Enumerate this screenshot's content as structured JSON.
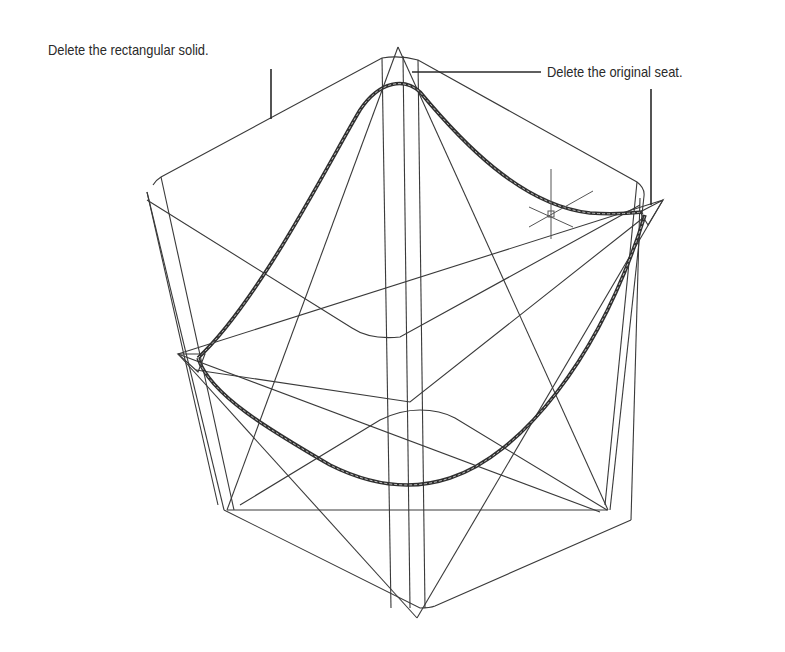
{
  "figure": {
    "width": 785,
    "height": 652,
    "background": "#ffffff",
    "line_color": "#3a3a3a",
    "seat_color": "#2f2f2f"
  },
  "callouts": {
    "rectangular_solid": {
      "text": "Delete the rectangular solid.",
      "leader": {
        "x1": 271,
        "y1": 69,
        "x2": 271,
        "y2": 119
      }
    },
    "original_seat": {
      "text": "Delete the original seat.",
      "leader_h": {
        "x1": 412,
        "y1": 72,
        "x2": 541,
        "y2": 72
      },
      "leader_v": {
        "x1": 651,
        "y1": 89,
        "x2": 651,
        "y2": 205
      }
    }
  },
  "cursor": {
    "type": "crosshair-pickbox",
    "x": 551,
    "y": 214
  },
  "geometry": {
    "box_outline_top": "M153,185 Q156,180 161,177 L382,58 Q400,55 418,60 L637,182 Q645,188 644,196",
    "box_outline_bottom": "M224,510 L420,608 Q430,608 435,606 L631,520",
    "box_verticals": [
      [
        147,
        192,
        224,
        510
      ],
      [
        161,
        177,
        234,
        510
      ],
      [
        147,
        192,
        218,
        505
      ],
      [
        382,
        58,
        391,
        608
      ],
      [
        403,
        56,
        410,
        608
      ],
      [
        418,
        60,
        425,
        608
      ],
      [
        644,
        196,
        610,
        510
      ],
      [
        637,
        182,
        605,
        505
      ],
      [
        631,
        520,
        640,
        198
      ]
    ],
    "inner_top_rect": "M147,200 L352,328 Q370,340 400,337 L640,205",
    "inner_bottom_rect": "M240,505 L380,420 Q400,410 420,410 Q440,410 455,418 L607,510",
    "middle_v": "M196,370 L410,402 L643,218",
    "star_lines": [
      [
        398,
        47,
        227,
        510
      ],
      [
        398,
        47,
        608,
        510
      ],
      [
        178,
        354,
        663,
        200
      ],
      [
        178,
        354,
        600,
        512
      ],
      [
        663,
        200,
        417,
        618
      ],
      [
        178,
        354,
        417,
        618
      ]
    ],
    "star_bottom_chord": [
      227,
      510,
      608,
      510
    ],
    "seat_upper": "M198,358 C260,300 330,160 360,110 C380,80 405,78 420,92 C460,140 520,205 590,213 Q615,215 643,212",
    "seat_lower": "M198,358 C210,395 270,430 330,465 C380,490 420,488 450,478 C520,455 600,360 645,215",
    "seat_tip_left": "M178,354 L205,354 L198,372 Z",
    "seat_tip_right": "M663,200 L640,212 L648,225 Z"
  }
}
